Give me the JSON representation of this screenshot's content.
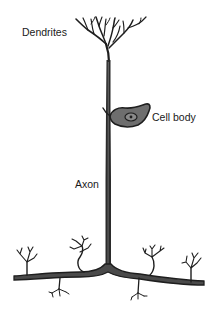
{
  "diagram": {
    "labels": {
      "dendrites": "Dendrites",
      "cell_body": "Cell body",
      "axon": "Axon"
    },
    "colors": {
      "line": "#1e1e1e",
      "cell_body_fill": "#6e6e6e",
      "background": "#ffffff"
    }
  }
}
